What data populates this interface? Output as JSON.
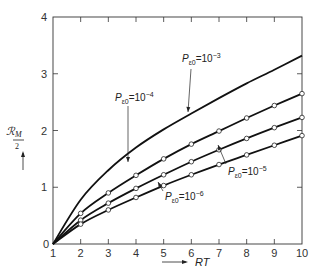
{
  "chart_data": {
    "type": "line",
    "title": "",
    "xlabel": "RT",
    "ylabel": "ℛM/2",
    "xlim": [
      1,
      10
    ],
    "ylim": [
      0,
      4
    ],
    "grid": false,
    "x_ticks": [
      "1",
      "2",
      "3",
      "4",
      "5",
      "6",
      "7",
      "8",
      "9",
      "10"
    ],
    "y_ticks": [
      "0",
      "1",
      "2",
      "3",
      "4"
    ],
    "x": [
      1,
      2,
      3,
      4,
      5,
      6,
      7,
      8,
      9,
      10
    ],
    "series": [
      {
        "name": "P_ε0 = 10^-3",
        "label_main": "P",
        "label_sub": "ε0",
        "label_eq": "=10",
        "label_exp": "−3",
        "values": [
          0,
          0.78,
          1.3,
          1.7,
          2.02,
          2.3,
          2.57,
          2.83,
          3.07,
          3.32
        ],
        "markers": false
      },
      {
        "name": "P_ε0 = 10^-4",
        "label_main": "P",
        "label_sub": "ε0",
        "label_eq": "=10",
        "label_exp": "−4",
        "values": [
          0,
          0.54,
          0.9,
          1.21,
          1.5,
          1.76,
          1.99,
          2.22,
          2.44,
          2.65
        ],
        "markers": true
      },
      {
        "name": "P_ε0 = 10^-5",
        "label_main": "P",
        "label_sub": "ε0",
        "label_eq": "=10",
        "label_exp": "−5",
        "values": [
          0,
          0.42,
          0.72,
          0.98,
          1.22,
          1.45,
          1.66,
          1.86,
          2.05,
          2.23
        ],
        "markers": true
      },
      {
        "name": "P_ε0 = 10^-6",
        "label_main": "P",
        "label_sub": "ε0",
        "label_eq": "=10",
        "label_exp": "−6",
        "values": [
          0,
          0.35,
          0.6,
          0.82,
          1.03,
          1.22,
          1.4,
          1.57,
          1.74,
          1.91
        ],
        "markers": true
      }
    ],
    "origin_label": "0",
    "axis_arrow_x": "RT",
    "axis_arrow_y": "ℛM/2"
  },
  "labels": {
    "y_axis_main": "ℛ",
    "y_axis_sub": "M",
    "y_axis_den": "2",
    "x_axis": "RT"
  }
}
